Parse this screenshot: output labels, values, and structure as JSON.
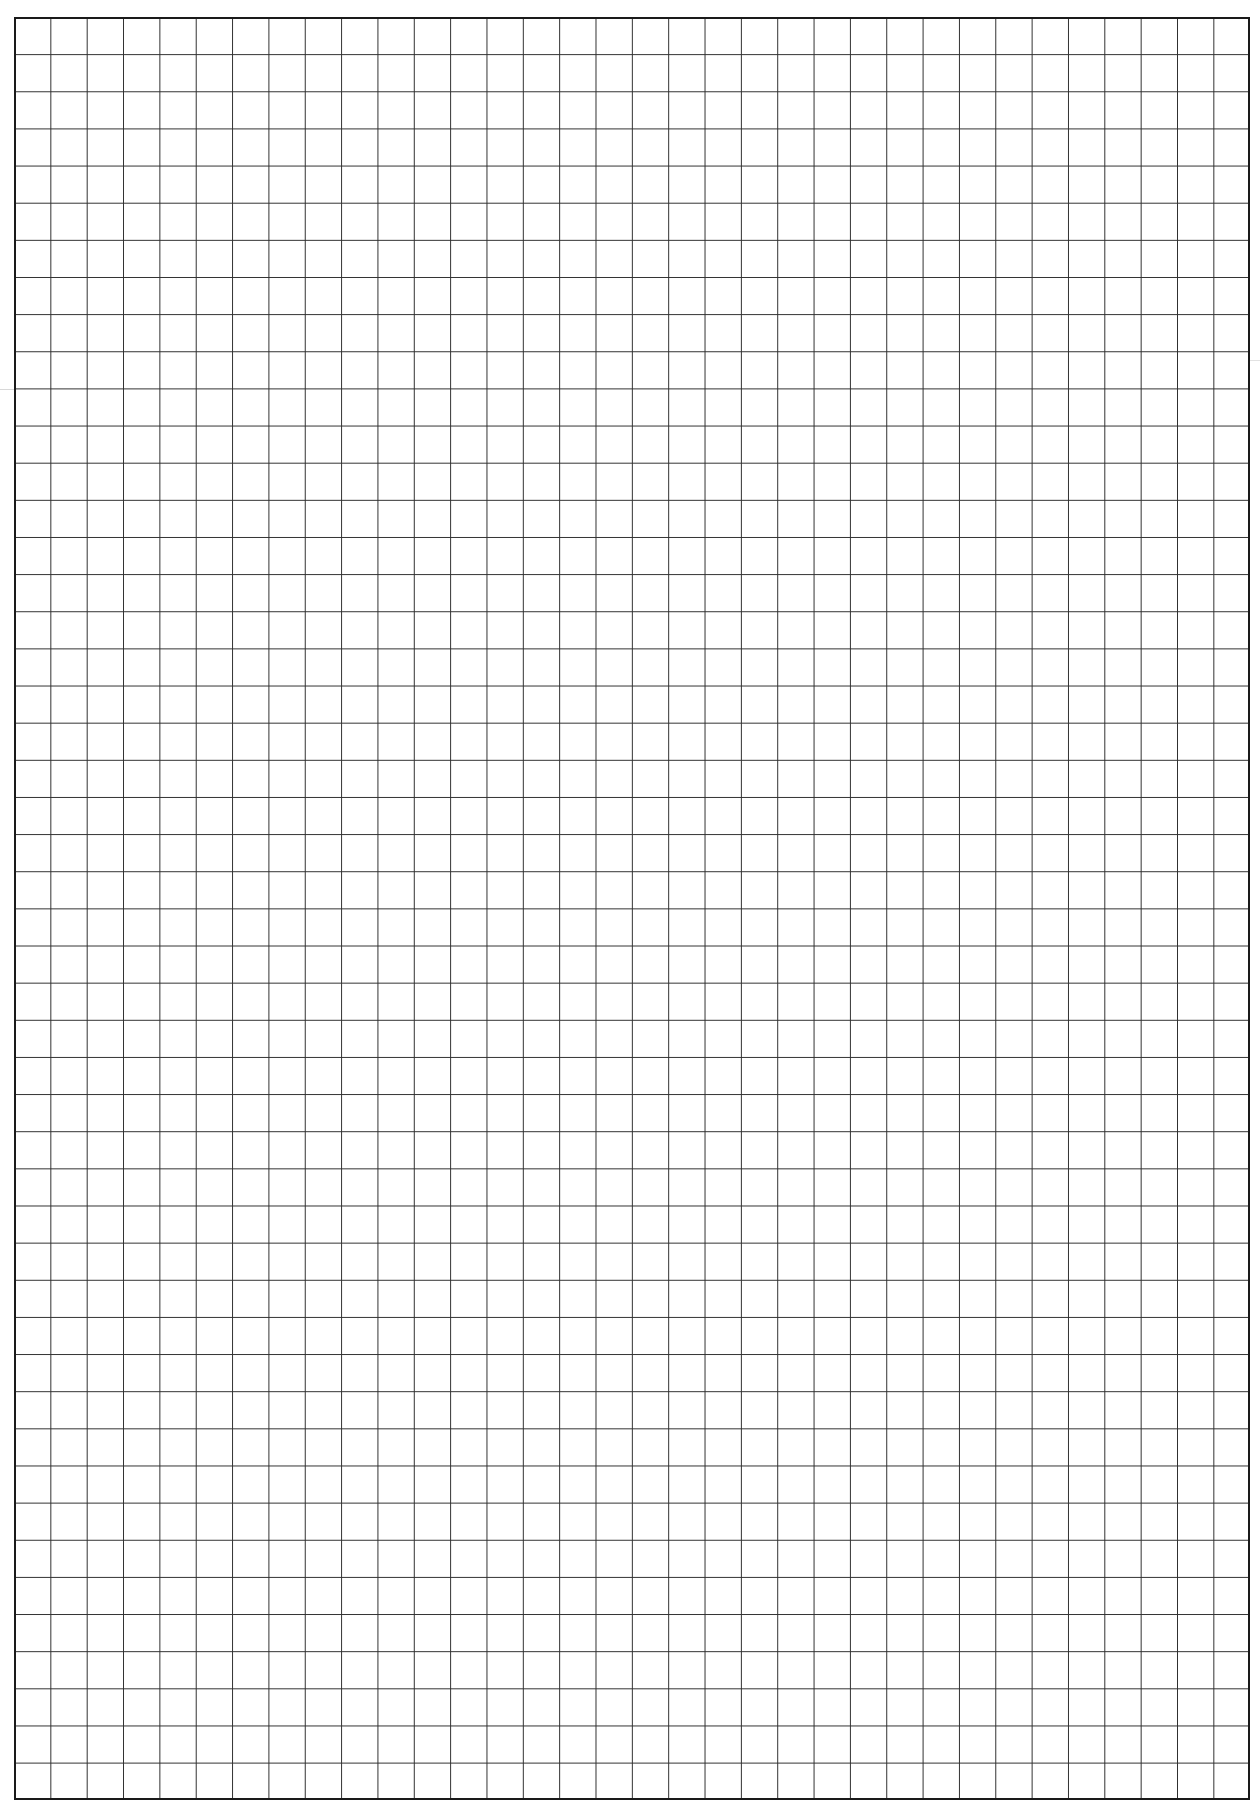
{
  "sheet": {
    "type": "graph-paper",
    "columns": 34,
    "rows": 48,
    "line_color": "#2e2e2e",
    "border_color": "#1a1a1a",
    "background_color": "#ffffff",
    "text_content": ""
  }
}
